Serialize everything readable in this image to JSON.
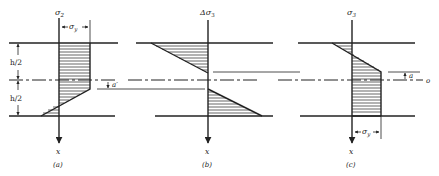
{
  "figure": {
    "panels": [
      {
        "id": "a",
        "caption": "(a)",
        "axis_label": "σ",
        "axis_label_sub": "2",
        "x_label": "x",
        "dim_top": "σ",
        "dim_top_sub": "y",
        "dim_left_upper": "h/2",
        "dim_left_lower": "h/2",
        "offset_label": "a′"
      },
      {
        "id": "b",
        "caption": "(b)",
        "axis_label": "Δσ",
        "axis_label_sub": "3",
        "x_label": "x"
      },
      {
        "id": "c",
        "caption": "(c)",
        "axis_label": "σ",
        "axis_label_sub": "3",
        "x_label": "x",
        "dim_bottom": "σ",
        "dim_bottom_sub": "y",
        "offset_label": "a",
        "centerline_label": "o"
      }
    ]
  }
}
